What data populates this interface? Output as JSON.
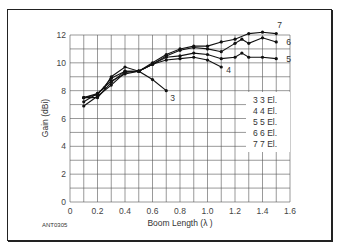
{
  "chart_data": {
    "type": "line",
    "title": "",
    "xlabel": "Boom Length (λ )",
    "ylabel": "Gain (dBi)",
    "xlim": [
      0,
      1.6
    ],
    "ylim": [
      0,
      12
    ],
    "xticks": [
      "0",
      "0.2",
      "0.4",
      "0.6",
      "0.8",
      "1.0",
      "1.2",
      "1.4",
      "1.6"
    ],
    "yticks": [
      "0",
      "2",
      "4",
      "6",
      "8",
      "10",
      "12"
    ],
    "grid": true,
    "legend_position": "right-middle-inside",
    "legend": [
      "3  3 El.",
      "4  4 El.",
      "5  5 El.",
      "6  6 El.",
      "7  7 El."
    ],
    "annotation": "ANT0305",
    "series": [
      {
        "name": "3 El.",
        "label": "3",
        "x": [
          0.1,
          0.2,
          0.3,
          0.4,
          0.5,
          0.6,
          0.7
        ],
        "y": [
          7.5,
          7.8,
          8.7,
          9.2,
          9.4,
          8.8,
          8.0
        ]
      },
      {
        "name": "4 El.",
        "label": "4",
        "x": [
          0.1,
          0.2,
          0.25,
          0.3,
          0.4,
          0.5,
          0.6,
          0.7,
          0.8,
          0.9,
          1.0,
          1.1
        ],
        "y": [
          7.2,
          7.8,
          8.2,
          9.0,
          9.7,
          9.4,
          9.9,
          10.2,
          10.3,
          10.4,
          10.2,
          9.7
        ]
      },
      {
        "name": "5 El.",
        "label": "5",
        "x": [
          0.1,
          0.2,
          0.3,
          0.4,
          0.5,
          0.6,
          0.7,
          0.8,
          0.9,
          1.0,
          1.1,
          1.2,
          1.25,
          1.3,
          1.4,
          1.5
        ],
        "y": [
          6.9,
          7.6,
          8.4,
          9.3,
          9.4,
          9.9,
          10.4,
          10.5,
          10.7,
          10.6,
          10.3,
          10.4,
          10.7,
          10.4,
          10.4,
          10.3
        ]
      },
      {
        "name": "6 El.",
        "label": "6",
        "x": [
          0.1,
          0.2,
          0.3,
          0.4,
          0.5,
          0.6,
          0.7,
          0.8,
          0.9,
          1.0,
          1.1,
          1.2,
          1.25,
          1.3,
          1.4,
          1.5
        ],
        "y": [
          7.5,
          7.5,
          8.6,
          9.4,
          9.4,
          9.9,
          10.5,
          10.9,
          11.1,
          11.0,
          10.8,
          11.4,
          11.7,
          11.4,
          11.8,
          11.5
        ]
      },
      {
        "name": "7 El.",
        "label": "7",
        "x": [
          0.1,
          0.2,
          0.3,
          0.4,
          0.5,
          0.6,
          0.7,
          0.8,
          0.9,
          1.0,
          1.1,
          1.2,
          1.3,
          1.4,
          1.5
        ],
        "y": [
          7.5,
          7.7,
          8.9,
          9.4,
          9.4,
          10.0,
          10.6,
          11.0,
          11.2,
          11.2,
          11.5,
          11.7,
          12.1,
          12.2,
          12.1
        ]
      }
    ]
  }
}
